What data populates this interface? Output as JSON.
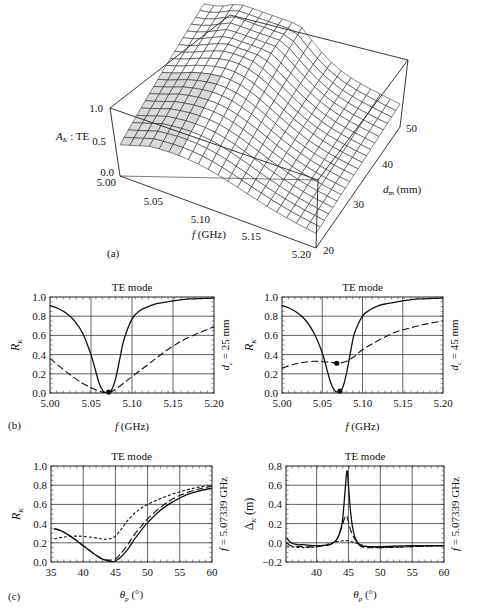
{
  "figure": {
    "panel_labels": {
      "a": "(a)",
      "b": "(b)",
      "c": "(c)"
    }
  },
  "chart_data": [
    {
      "id": "a",
      "type": "surface3d",
      "title": "",
      "zlabel": "A_K : TE",
      "zlabel_main": "A",
      "zlabel_sub": "K",
      "zlabel_rest": " : TE",
      "xlabel": "f (GHz)",
      "xlabel_italic": "f",
      "xlabel_rest": " (GHz)",
      "ylabel": "d_m (mm)",
      "ylabel_main": "d",
      "ylabel_sub": "m",
      "ylabel_rest": " (mm)",
      "x_ticks": [
        "5.00",
        "5.05",
        "5.10",
        "5.15",
        "5.20"
      ],
      "y_ticks": [
        "20",
        "30",
        "40",
        "50"
      ],
      "z_ticks": [
        "0.0",
        "0.5",
        "1.0"
      ],
      "xlim": [
        5.0,
        5.2
      ],
      "ylim": [
        20,
        50
      ],
      "zlim": [
        0,
        1
      ],
      "grid_lines": 20,
      "description": "Absorption surface peaking near f≈5.07 GHz for larger d_m, decaying toward higher f"
    },
    {
      "id": "b_left",
      "type": "line",
      "title": "TE mode",
      "xlabel": "f (GHz)",
      "ylabel": "R_K",
      "side_label": "d_c = 25 mm",
      "side_main": "d",
      "side_sub": "c",
      "side_rest": " = 25 mm",
      "xlim": [
        5.0,
        5.2
      ],
      "ylim": [
        0,
        1
      ],
      "x_ticks": [
        "5.00",
        "5.05",
        "5.10",
        "5.15",
        "5.20"
      ],
      "y_ticks": [
        "0.0",
        "0.2",
        "0.4",
        "0.6",
        "0.8",
        "1.0"
      ],
      "grid": true,
      "series": [
        {
          "name": "solid",
          "style": "solid",
          "x": [
            5.0,
            5.01,
            5.02,
            5.03,
            5.04,
            5.05,
            5.055,
            5.06,
            5.065,
            5.07,
            5.075,
            5.08,
            5.085,
            5.09,
            5.1,
            5.11,
            5.12,
            5.13,
            5.15,
            5.17,
            5.2
          ],
          "y": [
            0.91,
            0.88,
            0.83,
            0.75,
            0.62,
            0.4,
            0.25,
            0.1,
            0.02,
            0.0,
            0.03,
            0.15,
            0.35,
            0.55,
            0.77,
            0.86,
            0.9,
            0.93,
            0.96,
            0.98,
            0.99
          ]
        },
        {
          "name": "dashed",
          "style": "dashed",
          "x": [
            5.0,
            5.02,
            5.04,
            5.06,
            5.07,
            5.08,
            5.1,
            5.12,
            5.14,
            5.16,
            5.18,
            5.2
          ],
          "y": [
            0.36,
            0.22,
            0.1,
            0.02,
            0.0,
            0.04,
            0.17,
            0.3,
            0.43,
            0.54,
            0.62,
            0.69
          ]
        }
      ],
      "markers": [
        {
          "x": 5.0715,
          "y": 0.01
        }
      ]
    },
    {
      "id": "b_right",
      "type": "line",
      "title": "TE mode",
      "xlabel": "f (GHz)",
      "ylabel": "R_K",
      "side_label": "d_c = 45 mm",
      "side_main": "d",
      "side_sub": "c",
      "side_rest": " = 45 mm",
      "xlim": [
        5.0,
        5.2
      ],
      "ylim": [
        0,
        1
      ],
      "x_ticks": [
        "5.00",
        "5.05",
        "5.10",
        "5.15",
        "5.20"
      ],
      "y_ticks": [
        "0.0",
        "0.2",
        "0.4",
        "0.6",
        "0.8",
        "1.0"
      ],
      "grid": true,
      "series": [
        {
          "name": "solid",
          "style": "solid",
          "x": [
            5.0,
            5.01,
            5.02,
            5.03,
            5.04,
            5.05,
            5.055,
            5.06,
            5.065,
            5.07,
            5.075,
            5.08,
            5.085,
            5.09,
            5.1,
            5.11,
            5.12,
            5.13,
            5.15,
            5.17,
            5.2
          ],
          "y": [
            0.91,
            0.88,
            0.83,
            0.75,
            0.62,
            0.42,
            0.27,
            0.12,
            0.03,
            0.01,
            0.05,
            0.2,
            0.42,
            0.62,
            0.8,
            0.87,
            0.91,
            0.93,
            0.96,
            0.98,
            0.99
          ]
        },
        {
          "name": "dashed",
          "style": "dashed",
          "x": [
            5.0,
            5.02,
            5.04,
            5.06,
            5.07,
            5.08,
            5.09,
            5.1,
            5.12,
            5.14,
            5.16,
            5.18,
            5.2
          ],
          "y": [
            0.26,
            0.31,
            0.33,
            0.32,
            0.31,
            0.33,
            0.38,
            0.45,
            0.55,
            0.63,
            0.68,
            0.72,
            0.75
          ]
        }
      ],
      "markers": [
        {
          "x": 5.068,
          "y": 0.31
        },
        {
          "x": 5.072,
          "y": 0.02
        }
      ]
    },
    {
      "id": "c_left",
      "type": "line",
      "title": "TE mode",
      "xlabel": "θp (°)",
      "ylabel": "R_K",
      "side_label": "f = 5.07339 GHz",
      "xlim": [
        35,
        60
      ],
      "ylim": [
        0,
        1
      ],
      "x_ticks": [
        "35",
        "40",
        "45",
        "50",
        "55",
        "60"
      ],
      "y_ticks": [
        "0.0",
        "0.2",
        "0.4",
        "0.6",
        "0.8",
        "1.0"
      ],
      "grid": true,
      "series": [
        {
          "name": "solid",
          "style": "solid",
          "x": [
            35.5,
            36,
            37,
            38,
            39,
            40,
            41,
            42,
            43,
            44,
            44.5,
            45,
            46,
            47,
            48,
            49,
            50,
            52,
            54,
            56,
            58,
            60
          ],
          "y": [
            0.34,
            0.34,
            0.31,
            0.27,
            0.22,
            0.17,
            0.12,
            0.07,
            0.03,
            0.01,
            0.0,
            0.01,
            0.06,
            0.14,
            0.24,
            0.33,
            0.41,
            0.54,
            0.63,
            0.7,
            0.74,
            0.77
          ]
        },
        {
          "name": "long-dashed",
          "style": "dashed",
          "x": [
            35.5,
            36,
            37,
            38,
            39,
            40,
            41,
            42,
            43,
            44,
            45,
            46,
            47,
            48,
            49,
            50,
            52,
            54,
            56,
            58,
            60
          ],
          "y": [
            0.35,
            0.34,
            0.31,
            0.27,
            0.22,
            0.17,
            0.12,
            0.07,
            0.03,
            0.02,
            0.03,
            0.1,
            0.19,
            0.29,
            0.37,
            0.45,
            0.57,
            0.66,
            0.72,
            0.76,
            0.79
          ]
        },
        {
          "name": "short-dashed",
          "style": "dotted",
          "x": [
            35.5,
            37,
            39,
            41,
            43,
            44,
            45,
            46,
            47,
            48,
            49,
            50,
            52,
            54,
            56,
            58,
            60
          ],
          "y": [
            0.24,
            0.26,
            0.27,
            0.26,
            0.24,
            0.24,
            0.27,
            0.35,
            0.44,
            0.51,
            0.56,
            0.6,
            0.66,
            0.71,
            0.75,
            0.78,
            0.8
          ]
        }
      ]
    },
    {
      "id": "c_right",
      "type": "line",
      "title": "TE mode",
      "xlabel": "θp (°)",
      "ylabel": "Δ_K (m)",
      "side_label": "f = 5.07339 GHz",
      "xlim": [
        35.2,
        60
      ],
      "ylim": [
        -0.2,
        0.8
      ],
      "x_ticks": [
        "40",
        "45",
        "50",
        "55",
        "60"
      ],
      "x_tick_values": [
        40,
        45,
        50,
        55,
        60
      ],
      "y_ticks": [
        "-0.2",
        "0.0",
        "0.2",
        "0.4",
        "0.6",
        "0.8"
      ],
      "grid": true,
      "series": [
        {
          "name": "solid",
          "style": "solid",
          "x": [
            35.3,
            36,
            37,
            38,
            40,
            42,
            43,
            43.5,
            44,
            44.3,
            44.6,
            44.8,
            45,
            45.3,
            45.6,
            46,
            46.5,
            47,
            48,
            50,
            55,
            60
          ],
          "y": [
            0.05,
            0.0,
            -0.02,
            -0.02,
            -0.03,
            -0.02,
            0.02,
            0.08,
            0.2,
            0.4,
            0.65,
            0.75,
            0.6,
            0.35,
            0.18,
            0.06,
            0.0,
            -0.03,
            -0.04,
            -0.04,
            -0.03,
            -0.03
          ]
        },
        {
          "name": "long-dashed",
          "style": "dashed",
          "x": [
            35.3,
            36,
            38,
            40,
            42,
            43,
            43.5,
            44,
            44.4,
            44.7,
            45,
            45.4,
            46,
            46.5,
            47,
            48,
            50,
            55,
            60
          ],
          "y": [
            0.0,
            -0.03,
            -0.04,
            -0.04,
            -0.02,
            0.02,
            0.08,
            0.17,
            0.26,
            0.28,
            0.22,
            0.12,
            0.04,
            -0.01,
            -0.04,
            -0.05,
            -0.05,
            -0.04,
            -0.03
          ]
        },
        {
          "name": "short-dashed",
          "style": "dotted",
          "x": [
            35.3,
            36,
            38,
            40,
            42,
            43,
            44,
            45,
            46,
            47,
            48,
            50,
            55,
            60
          ],
          "y": [
            -0.03,
            -0.04,
            -0.05,
            -0.04,
            -0.01,
            0.01,
            0.02,
            0.02,
            0.0,
            -0.02,
            -0.04,
            -0.05,
            -0.04,
            -0.03
          ]
        }
      ]
    }
  ]
}
